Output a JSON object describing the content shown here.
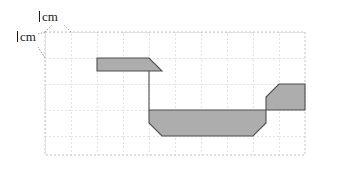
{
  "figure": {
    "kind": "grid-polygon-diagram",
    "labels": {
      "horizontal_unit": "cm",
      "vertical_unit": "cm",
      "unit_value": "1",
      "horizontal_full": "1 cm",
      "vertical_full": "1 cm"
    },
    "grid": {
      "origin_x": 45,
      "origin_y": 32,
      "cell_px": 26,
      "cols": 10,
      "rows": 5,
      "line_color": "#c8c8c8",
      "line_style": "dashed",
      "background": "#ffffff"
    },
    "shape": {
      "fill": "#adadad",
      "stroke": "#4a4a4a",
      "stroke_width": 1,
      "points_cells": [
        [
          2,
          1
        ],
        [
          4,
          1
        ],
        [
          5,
          2
        ],
        [
          4,
          2
        ],
        [
          4,
          4
        ],
        [
          4.5,
          4.5
        ],
        [
          8,
          4.5
        ],
        [
          8.5,
          4
        ],
        [
          8.5,
          2.5
        ],
        [
          9.5,
          1.5
        ],
        [
          12.5,
          1.5
        ],
        [
          12.5,
          3
        ],
        [
          8.5,
          3
        ],
        [
          8.5,
          3.5
        ],
        [
          5,
          3.5
        ],
        [
          5,
          2.6
        ],
        [
          2,
          2.6
        ]
      ]
    },
    "leader_lines": {
      "color": "#9a9a9a",
      "style": "dotted"
    }
  }
}
